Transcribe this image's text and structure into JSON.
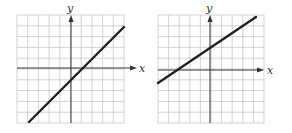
{
  "graphs": [
    {
      "id": "left",
      "x_label": "x",
      "y_label": "y",
      "grid": {
        "xmin": -5,
        "xmax": 5,
        "ymin": -5,
        "ymax": 5
      },
      "line": {
        "slope": 1,
        "intercept": -1,
        "equation": "y = x - 1"
      }
    },
    {
      "id": "right",
      "x_label": "x",
      "y_label": "y",
      "grid": {
        "xmin": -5,
        "xmax": 5,
        "ymin": -5,
        "ymax": 5
      },
      "line": {
        "slope": 0.6667,
        "intercept": 2,
        "equation": "y = (2/3)x + 2"
      }
    }
  ],
  "colors": {
    "grid": "#c8c8c8",
    "axis": "#333333",
    "line": "#222222",
    "background": "#ffffff"
  }
}
